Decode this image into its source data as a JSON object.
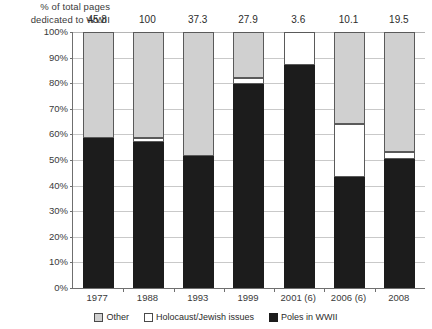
{
  "chart_data": {
    "type": "bar",
    "subtype": "100% stacked bar",
    "title": "",
    "ylabel": "% of  total pages dedicated to WWII",
    "xlabel": "",
    "ylim": [
      0,
      100
    ],
    "ytick_labels": [
      "100%",
      "90%",
      "80%",
      "70%",
      "60%",
      "50%",
      "40%",
      "30%",
      "20%",
      "10%",
      "0%"
    ],
    "ytick_values": [
      100,
      90,
      80,
      70,
      60,
      50,
      40,
      30,
      20,
      10,
      0
    ],
    "grid": true,
    "legend_position": "bottom",
    "categories": [
      "1977",
      "1988",
      "1993",
      "1999",
      "2001 (6)",
      "2006 (6)",
      "2008"
    ],
    "series": [
      {
        "name": "Poles in WWII",
        "color": "#1c1c1c",
        "values": [
          58.5,
          57.0,
          51.5,
          79.5,
          87.0,
          43.5,
          50.5
        ]
      },
      {
        "name": "Holocaust/Jewish issues",
        "color": "#ffffff",
        "values": [
          0.0,
          1.5,
          0.0,
          2.5,
          13.0,
          20.5,
          2.5
        ]
      },
      {
        "name": "Other",
        "color": "#d0d0d0",
        "values": [
          41.5,
          41.5,
          48.5,
          18.0,
          0.0,
          36.0,
          47.0
        ]
      }
    ],
    "bar_top_labels": [
      "45.8",
      "100",
      "37.3",
      "27.9",
      "3.6",
      "10.1",
      "19.5"
    ],
    "bar_top_label_note": "total pages dedicated to WWII"
  },
  "legend": {
    "items": [
      {
        "label": "Other",
        "key": "other"
      },
      {
        "label": "Holocaust/Jewish issues",
        "key": "holo"
      },
      {
        "label": "Poles in WWII",
        "key": "poles"
      }
    ]
  }
}
